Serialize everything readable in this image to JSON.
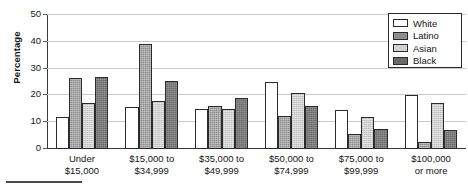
{
  "chart_data": {
    "type": "bar",
    "title": "",
    "subtitle": "",
    "xlabel": "",
    "ylabel": "Percentage",
    "ylim": [
      0,
      50
    ],
    "yticks": [
      0,
      10,
      20,
      30,
      40,
      50
    ],
    "grid": true,
    "legend_position": "top-right",
    "categories": [
      "Under $15,000",
      "$15,000 to $34,999",
      "$35,000 to $49,999",
      "$50,000 to $74,999",
      "$75,000 to $99,999",
      "$100,000 or more"
    ],
    "category_lines": [
      [
        "Under",
        "$15,000"
      ],
      [
        "$15,000 to",
        "$34,999"
      ],
      [
        "$35,000 to",
        "$49,999"
      ],
      [
        "$50,000 to",
        "$74,999"
      ],
      [
        "$75,000 to",
        "$99,999"
      ],
      [
        "$100,000",
        "or more"
      ]
    ],
    "series": [
      {
        "name": "White",
        "key": "white",
        "color": "#ffffff",
        "values": [
          12,
          15.5,
          15,
          25,
          14.5,
          20
        ]
      },
      {
        "name": "Latino",
        "key": "latino",
        "color": "#8e8e8e",
        "values": [
          26.5,
          39,
          16,
          12.5,
          5.5,
          2.5
        ]
      },
      {
        "name": "Asian",
        "key": "asian",
        "color": "#d2d2d2",
        "values": [
          17,
          18,
          15,
          21,
          12,
          17
        ]
      },
      {
        "name": "Black",
        "key": "black",
        "color": "#6a6a6a",
        "values": [
          27,
          25.5,
          19,
          16,
          7.5,
          7
        ]
      }
    ]
  },
  "legend": {
    "items": [
      {
        "label": "White",
        "key": "white"
      },
      {
        "label": "Latino",
        "key": "latino"
      },
      {
        "label": "Asian",
        "key": "asian"
      },
      {
        "label": "Black",
        "key": "black"
      }
    ]
  }
}
